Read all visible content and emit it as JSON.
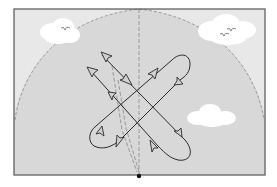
{
  "diagram": {
    "type": "sky-dome flight path diagram",
    "colors": {
      "background": "#ffffff",
      "sky_outer": "#e6e6e6",
      "dome_fill": "#d9d9d9",
      "frame": "#555555",
      "dashed": "#9a9a9a",
      "path": "#2b2b2b",
      "arrow_fill": "#d0d0d0",
      "cloud": "#ffffff",
      "bird": "#666666",
      "dot": "#111111"
    },
    "elements": {
      "frame": "rectangular border",
      "dome": "dashed semicircular dome arc",
      "zenith_line": "vertical dashed line",
      "observer_point": "black dot at bottom center",
      "clouds": [
        "top-left cloud",
        "top-right cloud",
        "right-middle cloud"
      ],
      "birds": [
        "bird in top-left cloud",
        "two birds in top-right cloud"
      ],
      "paths": [
        "crossing looping path A",
        "crossing looping path B",
        "diagonal arrow track"
      ]
    }
  }
}
